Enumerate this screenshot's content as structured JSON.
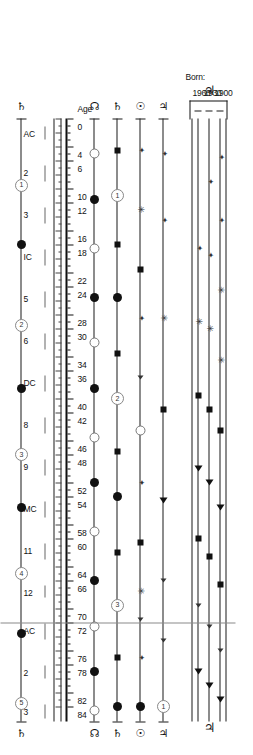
{
  "figure": {
    "type": "astrological-transit-timeline",
    "orientation": "rotated-90-clockwise",
    "axis_label": "Age",
    "born_label": "Born:"
  },
  "cohorts": {
    "label": "Born:",
    "years": [
      "1900",
      "1930",
      "1960"
    ],
    "group_glyph": "♃",
    "group_glyph_name": "jupiter-symbol"
  },
  "age_axis": {
    "label": "Age",
    "min": 0,
    "max": 85,
    "tick_labels": [
      "0",
      "4",
      "6",
      "10",
      "12",
      "16",
      "18",
      "22",
      "24",
      "28",
      "30",
      "34",
      "36",
      "40",
      "42",
      "46",
      "48",
      "52",
      "54",
      "58",
      "60",
      "64",
      "66",
      "70",
      "72",
      "76",
      "78",
      "82",
      "84"
    ],
    "tick_values": [
      0,
      4,
      6,
      10,
      12,
      16,
      18,
      22,
      24,
      28,
      30,
      34,
      36,
      40,
      42,
      46,
      48,
      52,
      54,
      58,
      60,
      64,
      66,
      70,
      72,
      76,
      78,
      82,
      84
    ],
    "minor_step": 1
  },
  "house_axis": {
    "labels": [
      "AC",
      "2",
      "3",
      "IC",
      "5",
      "6",
      "DC",
      "8",
      "9",
      "MC",
      "11",
      "12",
      "AC",
      "2",
      "3"
    ],
    "values": [
      1,
      6.5,
      12.5,
      18.5,
      24.5,
      30.5,
      36.5,
      42.5,
      48.5,
      54.5,
      60.5,
      66.5,
      72,
      78,
      83.5
    ]
  },
  "rows": [
    {
      "name": "cohort-1900",
      "glyph_left": "♃",
      "glyph_right": "",
      "glyph_name": "jupiter-symbol",
      "markers": [
        {
          "age": 5.5,
          "type": "plus"
        },
        {
          "age": 14.5,
          "type": "plus"
        },
        {
          "age": 24.5,
          "type": "star"
        },
        {
          "age": 34.5,
          "type": "star"
        },
        {
          "age": 44.5,
          "type": "sq"
        },
        {
          "age": 55.5,
          "type": "tri"
        },
        {
          "age": 66.5,
          "type": "sq"
        },
        {
          "age": 76.0,
          "type": "tri-sm"
        },
        {
          "age": 83.0,
          "type": "tri"
        }
      ]
    },
    {
      "name": "cohort-1930",
      "glyph_left": "♃",
      "glyph_right": "",
      "glyph_name": "jupiter-symbol",
      "markers": [
        {
          "age": 9.0,
          "type": "plus"
        },
        {
          "age": 19.5,
          "type": "plus"
        },
        {
          "age": 30.0,
          "type": "star"
        },
        {
          "age": 41.5,
          "type": "sq"
        },
        {
          "age": 52.0,
          "type": "tri"
        },
        {
          "age": 62.5,
          "type": "sq"
        },
        {
          "age": 72.5,
          "type": "tri-sm"
        },
        {
          "age": 81.0,
          "type": "tri"
        }
      ]
    },
    {
      "name": "cohort-1960",
      "glyph_left": "♃",
      "glyph_right": "",
      "glyph_name": "jupiter-symbol",
      "markers": [
        {
          "age": 18.5,
          "type": "plus"
        },
        {
          "age": 29.0,
          "type": "star"
        },
        {
          "age": 39.5,
          "type": "sq"
        },
        {
          "age": 50.0,
          "type": "tri"
        },
        {
          "age": 60.0,
          "type": "sq"
        },
        {
          "age": 69.5,
          "type": "tri-sm"
        },
        {
          "age": 79.0,
          "type": "tri"
        }
      ]
    },
    {
      "name": "row-jupiter",
      "glyph_left": "♃",
      "glyph_right": "♃",
      "glyph_name": "jupiter-symbol",
      "markers": [
        {
          "age": 5.0,
          "type": "plus"
        },
        {
          "age": 14.5,
          "type": "plus"
        },
        {
          "age": 28.5,
          "type": "star"
        },
        {
          "age": 41.5,
          "type": "sq"
        },
        {
          "age": 54.5,
          "type": "tri"
        },
        {
          "age": 66.0,
          "type": "tri-sm"
        },
        {
          "age": 74.5,
          "type": "tri-sm"
        },
        {
          "age": 84.0,
          "type": "ring",
          "value": "1"
        }
      ]
    },
    {
      "name": "row-sun",
      "glyph_left": "☉",
      "glyph_right": "☉",
      "glyph_name": "sun-symbol",
      "markers": [
        {
          "age": 4.5,
          "type": "plus"
        },
        {
          "age": 13.0,
          "type": "star"
        },
        {
          "age": 21.5,
          "type": "sq"
        },
        {
          "age": 28.5,
          "type": "plus"
        },
        {
          "age": 37.0,
          "type": "tri-sm"
        },
        {
          "age": 44.5,
          "type": "odot"
        },
        {
          "age": 52.0,
          "type": "plus"
        },
        {
          "age": 60.5,
          "type": "sq"
        },
        {
          "age": 67.5,
          "type": "star"
        },
        {
          "age": 71.5,
          "type": "tri-sm"
        },
        {
          "age": 77.0,
          "type": "plus"
        },
        {
          "age": 84.0,
          "type": "dot"
        }
      ]
    },
    {
      "name": "row-saturn",
      "glyph_left": "♄",
      "glyph_right": "♄",
      "glyph_name": "saturn-symbol",
      "markers": [
        {
          "age": 4.5,
          "type": "sq"
        },
        {
          "age": 11.0,
          "type": "ring",
          "value": "1"
        },
        {
          "age": 18.0,
          "type": "sq"
        },
        {
          "age": 25.5,
          "type": "dot"
        },
        {
          "age": 33.5,
          "type": "sq"
        },
        {
          "age": 40.0,
          "type": "ring",
          "value": "2"
        },
        {
          "age": 47.5,
          "type": "sq"
        },
        {
          "age": 54.0,
          "type": "dot"
        },
        {
          "age": 62.0,
          "type": "sq"
        },
        {
          "age": 69.5,
          "type": "ring",
          "value": "3"
        },
        {
          "age": 77.0,
          "type": "sq"
        },
        {
          "age": 84.0,
          "type": "dot"
        }
      ]
    },
    {
      "name": "row-moon",
      "glyph_left": "☊",
      "glyph_right": "☊",
      "glyph_name": "lunar-node-symbol",
      "markers": [
        {
          "age": 5.0,
          "type": "odot"
        },
        {
          "age": 11.5,
          "type": "dot"
        },
        {
          "age": 18.5,
          "type": "odot"
        },
        {
          "age": 25.5,
          "type": "dot"
        },
        {
          "age": 32.0,
          "type": "odot"
        },
        {
          "age": 38.5,
          "type": "dot"
        },
        {
          "age": 45.5,
          "type": "odot"
        },
        {
          "age": 52.0,
          "type": "dot"
        },
        {
          "age": 59.0,
          "type": "odot"
        },
        {
          "age": 66.0,
          "type": "dot"
        },
        {
          "age": 72.5,
          "type": "odot"
        },
        {
          "age": 79.0,
          "type": "dot"
        },
        {
          "age": 84.5,
          "type": "odot"
        }
      ]
    },
    {
      "name": "row-houses",
      "glyph_left": "♄",
      "glyph_right": "♄",
      "glyph_name": "saturn-symbol",
      "markers": [
        {
          "age": 9.5,
          "type": "ring",
          "value": "1"
        },
        {
          "age": 18.0,
          "type": "dot"
        },
        {
          "age": 29.5,
          "type": "ring",
          "value": "2"
        },
        {
          "age": 38.5,
          "type": "dot"
        },
        {
          "age": 48.0,
          "type": "ring",
          "value": "3"
        },
        {
          "age": 55.5,
          "type": "dot"
        },
        {
          "age": 65.0,
          "type": "ring",
          "value": "4"
        },
        {
          "age": 73.5,
          "type": "dot"
        },
        {
          "age": 83.5,
          "type": "ring",
          "value": "5"
        }
      ]
    }
  ],
  "chart_data": {
    "type": "scatter",
    "title": "",
    "xlabel": "Age",
    "ylabel": "",
    "xlim": [
      0,
      85
    ],
    "grid": false,
    "legend": "none",
    "x_ticks": [
      0,
      4,
      6,
      10,
      12,
      16,
      18,
      22,
      24,
      28,
      30,
      34,
      36,
      40,
      42,
      46,
      48,
      52,
      54,
      58,
      60,
      64,
      66,
      70,
      72,
      76,
      78,
      82,
      84
    ],
    "secondary_x_ticks": {
      "labels": [
        "AC",
        "2",
        "3",
        "IC",
        "5",
        "6",
        "DC",
        "8",
        "9",
        "MC",
        "11",
        "12",
        "AC",
        "2",
        "3"
      ],
      "values": [
        1,
        6.5,
        12.5,
        18.5,
        24.5,
        30.5,
        36.5,
        42.5,
        48.5,
        54.5,
        60.5,
        66.5,
        72,
        78,
        83.5
      ]
    },
    "series": [
      {
        "name": "1900",
        "x": [
          5.5,
          14.5,
          24.5,
          34.5,
          44.5,
          55.5,
          66.5,
          76.0,
          83.0
        ]
      },
      {
        "name": "1930",
        "x": [
          9.0,
          19.5,
          30.0,
          41.5,
          52.0,
          62.5,
          72.5,
          81.0
        ]
      },
      {
        "name": "1960",
        "x": [
          18.5,
          29.0,
          39.5,
          50.0,
          60.0,
          69.5,
          79.0
        ]
      },
      {
        "name": "♃",
        "x": [
          5.0,
          14.5,
          28.5,
          41.5,
          54.5,
          66.0,
          74.5,
          84.0
        ]
      },
      {
        "name": "☉",
        "x": [
          4.5,
          13.0,
          21.5,
          28.5,
          37.0,
          44.5,
          52.0,
          60.5,
          67.5,
          71.5,
          77.0,
          84.0
        ]
      },
      {
        "name": "♄",
        "x": [
          4.5,
          11.0,
          18.0,
          25.5,
          33.5,
          40.0,
          47.5,
          54.0,
          62.0,
          69.5,
          77.0,
          84.0
        ]
      },
      {
        "name": "☊",
        "x": [
          5.0,
          11.5,
          18.5,
          25.5,
          32.0,
          38.5,
          45.5,
          52.0,
          59.0,
          66.0,
          72.5,
          79.0,
          84.5
        ]
      },
      {
        "name": "houses",
        "x": [
          9.5,
          18.0,
          29.5,
          38.5,
          48.0,
          55.5,
          65.0,
          73.5,
          83.5
        ]
      }
    ]
  }
}
